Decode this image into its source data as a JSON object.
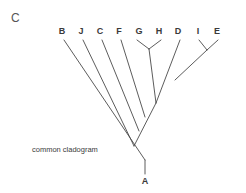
{
  "figure": {
    "panel_label": "C",
    "caption": "common cladogram",
    "background_color": "#ffffff",
    "line_color": "#4a4a4a",
    "text_color": "#3a3a3a"
  },
  "tips": [
    {
      "name": "B",
      "x": 62,
      "y": 34
    },
    {
      "name": "J",
      "x": 81,
      "y": 34
    },
    {
      "name": "C",
      "x": 100,
      "y": 34
    },
    {
      "name": "F",
      "x": 119,
      "y": 34
    },
    {
      "name": "G",
      "x": 139,
      "y": 34
    },
    {
      "name": "H",
      "x": 159,
      "y": 34
    },
    {
      "name": "D",
      "x": 178,
      "y": 34
    },
    {
      "name": "I",
      "x": 198,
      "y": 34
    },
    {
      "name": "E",
      "x": 217,
      "y": 34
    }
  ],
  "root": {
    "name": "A",
    "x": 145,
    "y": 181
  },
  "chart_data": {
    "type": "diagram",
    "diagram_kind": "cladogram",
    "title": "common cladogram",
    "panel": "C",
    "root_taxon": "A",
    "tip_taxa": [
      "B",
      "J",
      "C",
      "F",
      "G",
      "H",
      "D",
      "I",
      "E"
    ],
    "topology": "(B,(J,(C,(F,((G,H),(D,(I,E)))))))",
    "branching_order_from_root": [
      "B",
      "J",
      "C",
      "F",
      "(G,H)",
      "(D,(I,E))"
    ],
    "clades": [
      {
        "name": "G-H clade",
        "members": [
          "G",
          "H"
        ],
        "node_x": 149,
        "node_y": 49
      },
      {
        "name": "I-E clade",
        "members": [
          "I",
          "E"
        ],
        "node_x": 207,
        "node_y": 50
      },
      {
        "name": "D + (I,E) clade",
        "members": [
          "D",
          "I",
          "E"
        ],
        "node_x": 175,
        "node_y": 80
      },
      {
        "name": "(G,H) + (D,(I,E)) clade",
        "members": [
          "G",
          "H",
          "D",
          "I",
          "E"
        ],
        "node_x": 156,
        "node_y": 103
      },
      {
        "name": "F clade",
        "members": [
          "F",
          "G",
          "H",
          "D",
          "I",
          "E"
        ],
        "node_x": 145,
        "node_y": 117
      },
      {
        "name": "C clade",
        "members": [
          "C",
          "F",
          "G",
          "H",
          "D",
          "I",
          "E"
        ],
        "node_x": 139,
        "node_y": 131
      },
      {
        "name": "J clade",
        "members": [
          "J",
          "C",
          "F",
          "G",
          "H",
          "D",
          "I",
          "E"
        ],
        "node_x": 134,
        "node_y": 146
      },
      {
        "name": "root clade",
        "members": [
          "B",
          "J",
          "C",
          "F",
          "G",
          "H",
          "D",
          "I",
          "E"
        ],
        "node_x": 145,
        "node_y": 160
      }
    ],
    "branches": [
      {
        "label": "B-branch",
        "from_x": 64,
        "from_y": 40,
        "to_x": 145,
        "to_y": 160
      },
      {
        "label": "J-branch",
        "from_x": 83,
        "from_y": 40,
        "to_x": 134,
        "to_y": 146
      },
      {
        "label": "C-branch",
        "from_x": 102,
        "from_y": 40,
        "to_x": 139,
        "to_y": 131
      },
      {
        "label": "F-branch",
        "from_x": 121,
        "from_y": 40,
        "to_x": 145,
        "to_y": 117
      },
      {
        "label": "G-branch",
        "from_x": 137,
        "from_y": 40,
        "to_x": 149,
        "to_y": 49
      },
      {
        "label": "H-branch",
        "from_x": 161,
        "from_y": 40,
        "to_x": 149,
        "to_y": 49
      },
      {
        "label": "GH-stem",
        "from_x": 149,
        "from_y": 49,
        "to_x": 156,
        "to_y": 103
      },
      {
        "label": "D-branch",
        "from_x": 180,
        "from_y": 40,
        "to_x": 156,
        "to_y": 103
      },
      {
        "label": "I-branch",
        "from_x": 199,
        "from_y": 40,
        "to_x": 207,
        "to_y": 50
      },
      {
        "label": "E-branch",
        "from_x": 218,
        "from_y": 40,
        "to_x": 207,
        "to_y": 50
      },
      {
        "label": "IE-stem",
        "from_x": 207,
        "from_y": 50,
        "to_x": 175,
        "to_y": 80
      },
      {
        "label": "backbone-spine",
        "from_x": 156,
        "from_y": 103,
        "to_x": 134,
        "to_y": 146
      },
      {
        "label": "root-stem",
        "from_x": 145,
        "from_y": 160,
        "to_x": 145,
        "to_y": 174
      }
    ]
  },
  "caption_position": {
    "x": 32,
    "y": 146
  },
  "panel_position": {
    "x": 11,
    "y": 12
  }
}
